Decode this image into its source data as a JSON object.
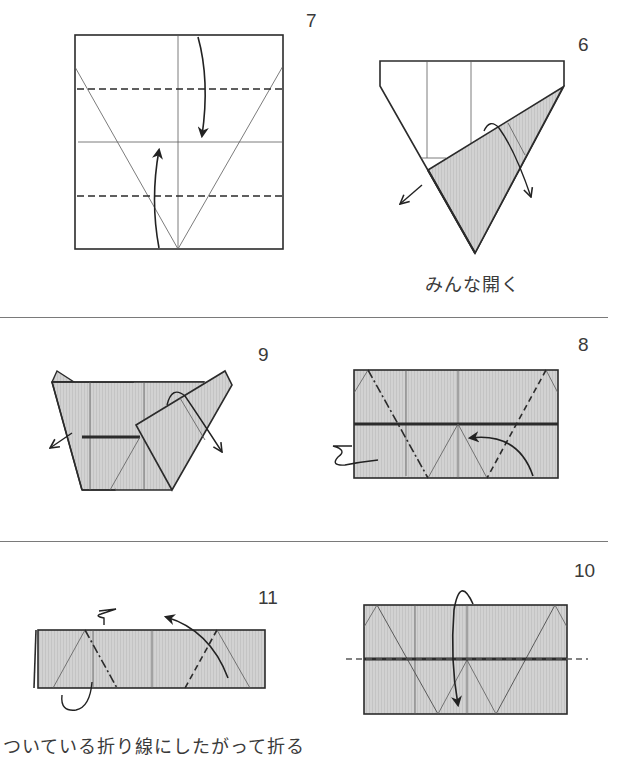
{
  "colors": {
    "paper_white": "#ffffff",
    "paper_gray": "#cfcfcf",
    "line": "#2b2b2b",
    "crease": "#5a5a5a",
    "divider": "#7a7a7a"
  },
  "steps": [
    {
      "number": "7",
      "caption": ""
    },
    {
      "number": "6",
      "caption": "みんな開く"
    },
    {
      "number": "9",
      "caption": ""
    },
    {
      "number": "8",
      "caption": ""
    },
    {
      "number": "11",
      "caption": "ついている折り線にしたがって折る"
    },
    {
      "number": "10",
      "caption": ""
    }
  ],
  "legend": {
    "dashed_line": "valley fold",
    "dash_dot_line": "mountain fold",
    "arrow": "fold direction"
  }
}
